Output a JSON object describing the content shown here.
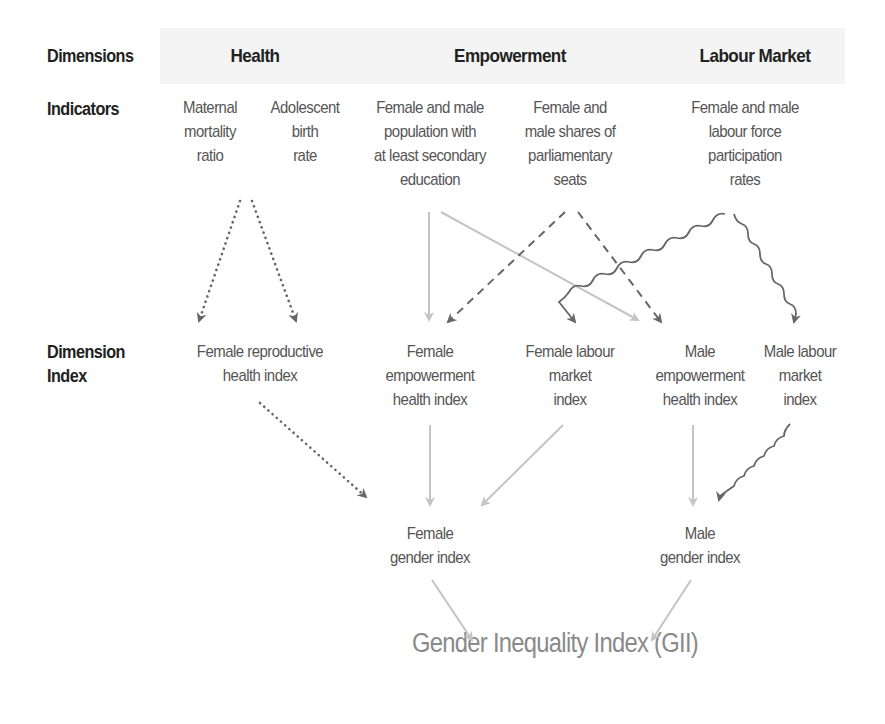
{
  "row_headers": {
    "dimensions": "Dimensions",
    "indicators": "Indicators",
    "dimension_index": "Dimension\nIndex"
  },
  "dimensions": {
    "health": "Health",
    "empowerment": "Empowerment",
    "labour_market": "Labour Market"
  },
  "indicators": {
    "maternal_mortality": "Maternal\nmortality\nratio",
    "adolescent_birth": "Adolescent\nbirth\nrate",
    "secondary_education": "Female and male\npopulation with\nat least secondary\neducation",
    "parliament_seats": "Female and\nmale shares of\nparliamentary\nseats",
    "labour_force": "Female and male\nlabour force\nparticipation\nrates"
  },
  "dimension_indices": {
    "female_reproductive_health": "Female reproductive\nhealth index",
    "female_empowerment": "Female\nempowerment\nhealth index",
    "female_labour_market": "Female labour\nmarket\nindex",
    "male_empowerment": "Male\nempowerment\nhealth index",
    "male_labour_market": "Male labour\nmarket\nindex"
  },
  "gender_indices": {
    "female": "Female\ngender index",
    "male": "Male\ngender index"
  },
  "final_index": "Gender Inequality Index (GII)",
  "colors": {
    "header_band": "#f4f4f4",
    "dark_arrow": "#666666",
    "light_arrow": "#c4c4c4",
    "final_text": "#8a8a8a"
  },
  "edges": [
    {
      "from": "maternal_mortality+adolescent_birth",
      "to": "female_reproductive_health",
      "style": "dotted"
    },
    {
      "from": "maternal_mortality+adolescent_birth",
      "to": "female_reproductive_health",
      "style": "dotted"
    },
    {
      "from": "secondary_education",
      "to": "female_empowerment",
      "style": "light-solid"
    },
    {
      "from": "secondary_education",
      "to": "male_empowerment",
      "style": "light-solid"
    },
    {
      "from": "parliament_seats",
      "to": "female_empowerment",
      "style": "dashed"
    },
    {
      "from": "parliament_seats",
      "to": "male_empowerment",
      "style": "dashed"
    },
    {
      "from": "labour_force",
      "to": "female_labour_market",
      "style": "wavy"
    },
    {
      "from": "labour_force",
      "to": "male_labour_market",
      "style": "wavy"
    },
    {
      "from": "female_reproductive_health",
      "to": "female_gender",
      "style": "dotted"
    },
    {
      "from": "female_empowerment",
      "to": "female_gender",
      "style": "light-solid"
    },
    {
      "from": "female_labour_market",
      "to": "female_gender",
      "style": "light-solid"
    },
    {
      "from": "male_empowerment",
      "to": "male_gender",
      "style": "light-solid"
    },
    {
      "from": "male_labour_market",
      "to": "male_gender",
      "style": "wavy"
    },
    {
      "from": "female_gender",
      "to": "gii",
      "style": "light-solid"
    },
    {
      "from": "male_gender",
      "to": "gii",
      "style": "light-solid"
    }
  ]
}
